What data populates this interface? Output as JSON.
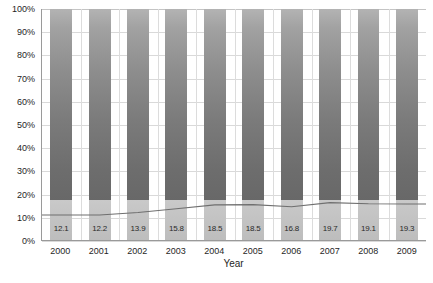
{
  "chart_data": {
    "type": "bar",
    "title": "",
    "xlabel": "Year",
    "ylabel": "",
    "categories": [
      "2000",
      "2001",
      "2002",
      "2003",
      "2004",
      "2005",
      "2006",
      "2007",
      "2008",
      "2009"
    ],
    "bar_values": [
      100,
      100,
      100,
      100,
      100,
      100,
      100,
      100,
      100,
      100
    ],
    "data_labels": [
      "12.1",
      "12.2",
      "13.9",
      "15.8",
      "18.5",
      "18.5",
      "16.8",
      "19.7",
      "19.1",
      "19.3"
    ],
    "series": [
      {
        "name": "bars",
        "type": "bar",
        "values": [
          100,
          100,
          100,
          100,
          100,
          100,
          100,
          100,
          100,
          100
        ]
      },
      {
        "name": "line",
        "type": "line",
        "values": [
          10.8,
          10.8,
          11.9,
          13.5,
          15.2,
          15.3,
          14.4,
          16.2,
          15.7,
          15.6
        ]
      }
    ],
    "ylim": [
      0,
      100
    ],
    "ytick_labels": [
      "0%",
      "10%",
      "20%",
      "30%",
      "40%",
      "50%",
      "60%",
      "70%",
      "80%",
      "90%",
      "100%"
    ],
    "ytick_values": [
      0,
      10,
      20,
      30,
      40,
      50,
      60,
      70,
      80,
      90,
      100
    ],
    "grid": {
      "horizontal": true,
      "vertical": true
    },
    "legend": {
      "visible": false,
      "position": "none"
    },
    "colors": {
      "bar_top": "#b3b3b3",
      "bar_bottom": "#666666",
      "bar_foot": "#c5c5c5",
      "line": "#6f6f6f",
      "gridline": "#d9d9d9",
      "axis": "#9a9a9a",
      "text": "#1f1f1f"
    }
  },
  "axis": {
    "x_title": "Year",
    "y_ticks": [
      "100%",
      "90%",
      "80%",
      "70%",
      "60%",
      "50%",
      "40%",
      "30%",
      "20%",
      "10%",
      "0%"
    ],
    "x_ticks": [
      "2000",
      "2001",
      "2002",
      "2003",
      "2004",
      "2005",
      "2006",
      "2007",
      "2008",
      "2009"
    ]
  },
  "caption": {
    "text": ""
  }
}
